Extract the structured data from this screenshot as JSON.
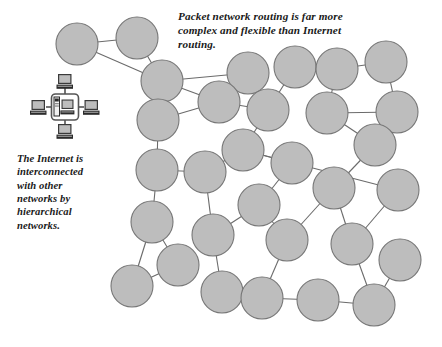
{
  "figure": {
    "background_color": "#ffffff",
    "width": 442,
    "height": 347
  },
  "captions": {
    "top": {
      "text": "Packet network routing is far more\ncomplex and flexible than Internet\nrouting.",
      "style": "bold-italic-serif",
      "color": "#1a1a1a"
    },
    "left": {
      "text": "The Internet is\ninterconnected\nwith other\nnetworks by\nhierarchical\nnetworks.",
      "style": "bold-italic-serif",
      "color": "#1a1a1a"
    }
  },
  "lan_icon": {
    "name": "internet-lan-cluster-icon",
    "description": "Local area network cluster: a rounded box containing a server tower and desktop monitor, with four client computers attached top, left, right and bottom",
    "box_color": "#ffffff",
    "box_border_color": "#555555",
    "screen_color": "#bdbdbd",
    "body_color": "#2b2b2b"
  },
  "network": {
    "node_fill": "#bdbdbd",
    "node_stroke": "#767676",
    "link_stroke": "#6b6b6b",
    "node_radius": 21,
    "nodes": [
      {
        "id": "n1",
        "cx": 77,
        "cy": 44
      },
      {
        "id": "n2",
        "cx": 137,
        "cy": 38
      },
      {
        "id": "n3",
        "cx": 162,
        "cy": 81
      },
      {
        "id": "n4",
        "cx": 248,
        "cy": 73
      },
      {
        "id": "n5",
        "cx": 295,
        "cy": 67
      },
      {
        "id": "n6",
        "cx": 337,
        "cy": 69
      },
      {
        "id": "n7",
        "cx": 386,
        "cy": 62
      },
      {
        "id": "n8",
        "cx": 397,
        "cy": 112
      },
      {
        "id": "n9",
        "cx": 219,
        "cy": 102
      },
      {
        "id": "n10",
        "cx": 268,
        "cy": 110
      },
      {
        "id": "n11",
        "cx": 327,
        "cy": 113
      },
      {
        "id": "n12",
        "cx": 158,
        "cy": 120
      },
      {
        "id": "n13",
        "cx": 243,
        "cy": 150
      },
      {
        "id": "n14",
        "cx": 292,
        "cy": 163
      },
      {
        "id": "n15",
        "cx": 375,
        "cy": 145
      },
      {
        "id": "n16",
        "cx": 157,
        "cy": 170
      },
      {
        "id": "n17",
        "cx": 205,
        "cy": 172
      },
      {
        "id": "n18",
        "cx": 334,
        "cy": 188
      },
      {
        "id": "n19",
        "cx": 398,
        "cy": 190
      },
      {
        "id": "n20",
        "cx": 152,
        "cy": 222
      },
      {
        "id": "n21",
        "cx": 259,
        "cy": 205
      },
      {
        "id": "n22",
        "cx": 213,
        "cy": 235
      },
      {
        "id": "n23",
        "cx": 287,
        "cy": 240
      },
      {
        "id": "n24",
        "cx": 352,
        "cy": 244
      },
      {
        "id": "n25",
        "cx": 400,
        "cy": 260
      },
      {
        "id": "n26",
        "cx": 178,
        "cy": 265
      },
      {
        "id": "n27",
        "cx": 132,
        "cy": 286
      },
      {
        "id": "n28",
        "cx": 222,
        "cy": 292
      },
      {
        "id": "n29",
        "cx": 262,
        "cy": 298
      },
      {
        "id": "n30",
        "cx": 318,
        "cy": 300
      },
      {
        "id": "n31",
        "cx": 374,
        "cy": 305
      }
    ],
    "links": [
      [
        "n1",
        "n2"
      ],
      [
        "n1",
        "n3"
      ],
      [
        "n2",
        "n3"
      ],
      [
        "n3",
        "n4"
      ],
      [
        "n3",
        "n9"
      ],
      [
        "n3",
        "n12"
      ],
      [
        "n4",
        "n9"
      ],
      [
        "n4",
        "n10"
      ],
      [
        "n5",
        "n6"
      ],
      [
        "n5",
        "n10"
      ],
      [
        "n6",
        "n7"
      ],
      [
        "n6",
        "n11"
      ],
      [
        "n7",
        "n8"
      ],
      [
        "n8",
        "n11"
      ],
      [
        "n9",
        "n10"
      ],
      [
        "n9",
        "n12"
      ],
      [
        "n10",
        "n13"
      ],
      [
        "n11",
        "n15"
      ],
      [
        "n12",
        "n16"
      ],
      [
        "n13",
        "n14"
      ],
      [
        "n13",
        "n17"
      ],
      [
        "n13",
        "n19"
      ],
      [
        "n14",
        "n21"
      ],
      [
        "n15",
        "n18"
      ],
      [
        "n16",
        "n17"
      ],
      [
        "n16",
        "n20"
      ],
      [
        "n17",
        "n22"
      ],
      [
        "n18",
        "n23"
      ],
      [
        "n18",
        "n24"
      ],
      [
        "n19",
        "n24"
      ],
      [
        "n20",
        "n26"
      ],
      [
        "n20",
        "n27"
      ],
      [
        "n21",
        "n22"
      ],
      [
        "n21",
        "n23"
      ],
      [
        "n22",
        "n28"
      ],
      [
        "n23",
        "n29"
      ],
      [
        "n24",
        "n31"
      ],
      [
        "n25",
        "n31"
      ],
      [
        "n26",
        "n27"
      ],
      [
        "n29",
        "n30"
      ],
      [
        "n30",
        "n31"
      ]
    ]
  }
}
